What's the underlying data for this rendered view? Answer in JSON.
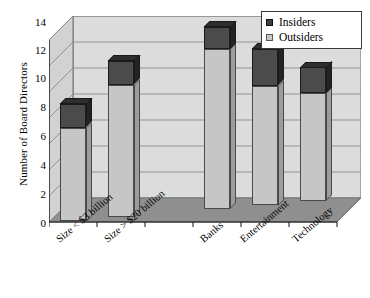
{
  "chart_data": {
    "type": "bar",
    "title": "",
    "subtitle": "",
    "xlabel": "",
    "ylabel": "Number of Board Directors",
    "ylim": [
      0,
      14
    ],
    "ytick_step": 2,
    "yticks": [
      "14",
      "12",
      "10",
      "8",
      "6",
      "4",
      "2",
      "0"
    ],
    "grid": true,
    "stacked": true,
    "three_d": true,
    "legend_position": "top-right",
    "categories": [
      "Size < $3 billion",
      "Size > $20 billion",
      "",
      "Banks",
      "Entertainment",
      "Technology"
    ],
    "series": [
      {
        "name": "Outsiders",
        "color": "#c6c6c6",
        "values": [
          7.2,
          10.2,
          null,
          12.3,
          9.2,
          8.3
        ]
      },
      {
        "name": "Insiders",
        "color": "#3d3d3d",
        "values": [
          1.8,
          1.8,
          null,
          1.7,
          2.8,
          2.0
        ]
      }
    ],
    "totals": [
      9.0,
      12.0,
      null,
      14.0,
      12.0,
      10.3
    ]
  },
  "legend": {
    "items": [
      {
        "label": "Insiders",
        "swatch": "insiders-swatch"
      },
      {
        "label": "Outsiders",
        "swatch": "outsiders-swatch"
      }
    ]
  }
}
